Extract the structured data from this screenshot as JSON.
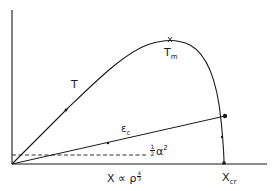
{
  "diagram": {
    "type": "schematic-plot",
    "axes": {
      "x_label_main": "X ∝ ρ",
      "x_label_exponent_num": "4",
      "x_label_exponent_den": "3",
      "y_label": ""
    },
    "curves": {
      "temperature": {
        "label": "T"
      },
      "temperature_max": {
        "label_main": "T",
        "label_sub": "m"
      },
      "epsilon_c": {
        "label_main": "ε",
        "label_sub": "c"
      },
      "threshold": {
        "label_frac_num": "1",
        "label_frac_den": "2",
        "label_main": "α",
        "label_sup": "2"
      }
    },
    "critical_point": {
      "label_main": "X",
      "label_sub": "cr"
    },
    "colors": {
      "ink": "#1a1a1a",
      "background": "#ffffff"
    }
  }
}
